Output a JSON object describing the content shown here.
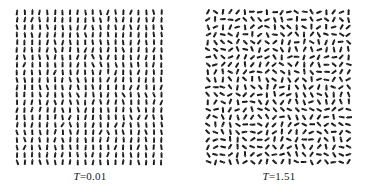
{
  "figure": {
    "title": "",
    "background_color": "#ffffff",
    "spin_color": "#1a1a1a",
    "width": 367,
    "height": 192
  },
  "panels": [
    {
      "id": "left-panel",
      "name": "ordered-low-temperature-lattice",
      "caption_variable": "T",
      "caption_rest": "=0.01",
      "caption_full": "T=0.01",
      "temperature": 0.01,
      "state": "ordered",
      "x": 14,
      "y": 8,
      "plot_width": 152,
      "plot_height": 158,
      "caption_y": 170,
      "grid": {
        "cols": 20,
        "rows": 21,
        "spacing_x": 7.6,
        "spacing_y": 7.5
      },
      "spin": {
        "length": 6.0,
        "thickness": 1.9,
        "head_length": 2.0,
        "head_width": 2.6
      },
      "angle_mean_deg": 90,
      "angle_spread_deg": 11,
      "seed": 12345
    },
    {
      "id": "right-panel",
      "name": "disordered-high-temperature-lattice",
      "caption_variable": "T",
      "caption_rest": "=1.51",
      "caption_full": "T=1.51",
      "temperature": 1.51,
      "state": "disordered",
      "x": 205,
      "y": 8,
      "plot_width": 148,
      "plot_height": 158,
      "caption_y": 170,
      "grid": {
        "cols": 20,
        "rows": 21,
        "spacing_x": 7.4,
        "spacing_y": 7.5
      },
      "spin": {
        "length": 6.2,
        "thickness": 2.0,
        "head_length": 2.2,
        "head_width": 2.8
      },
      "angle_mean_deg": 0,
      "angle_spread_deg": 180,
      "seed": 987654
    }
  ],
  "chart_data": {
    "type": "quiver",
    "title": "",
    "xlabel": "",
    "ylabel": "",
    "panel_captions": [
      "T=0.01",
      "T=1.51"
    ],
    "temperatures": [
      0.01,
      1.51
    ],
    "lattice_size": [
      20,
      21
    ],
    "series": [
      {
        "name": "T=0.01",
        "state": "ordered",
        "mean_angle_deg": 90,
        "angle_std_deg": 11,
        "order_parameter": 0.98
      },
      {
        "name": "T=1.51",
        "state": "disordered",
        "mean_angle_deg": 0,
        "angle_std_deg": 104,
        "order_parameter": 0.12
      }
    ]
  }
}
